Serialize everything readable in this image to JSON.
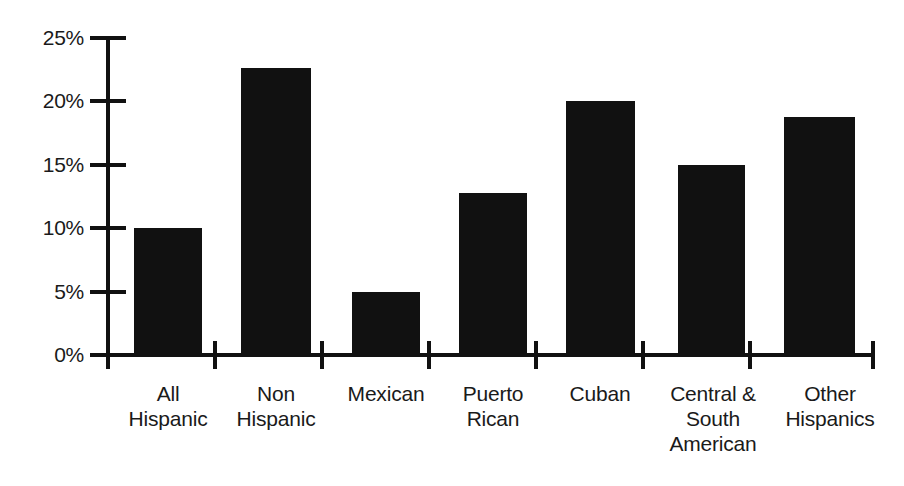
{
  "chart_data": {
    "type": "bar",
    "title": "",
    "subtitle": "",
    "xlabel": "",
    "ylabel": "",
    "categories": [
      "All\nHispanic",
      "Non\nHispanic",
      "Mexican",
      "Puerto\nRican",
      "Cuban",
      "Central &\nSouth\nAmerican",
      "Other\nHispanics"
    ],
    "categories_flat": [
      "All Hispanic",
      "Non Hispanic",
      "Mexican",
      "Puerto Rican",
      "Cuban",
      "Central & South American",
      "Other Hispanics"
    ],
    "values": [
      10.0,
      22.6,
      5.0,
      12.8,
      20.0,
      15.0,
      18.8
    ],
    "value_labels": [
      "10%",
      "22.6%",
      "5%",
      "12.8%",
      "20%",
      "15%",
      "18.8%"
    ],
    "ylim": [
      0,
      25
    ],
    "ytick_values": [
      25,
      20,
      15,
      10,
      5,
      0
    ],
    "ytick_labels": [
      "25%",
      "20%",
      "15%",
      "10%",
      "5%",
      "0%"
    ],
    "grid": false,
    "legend": null,
    "legend_position": "none",
    "bar_color": "#111111",
    "axis_color": "#111111",
    "background_color": "#ffffff",
    "annotations": []
  }
}
